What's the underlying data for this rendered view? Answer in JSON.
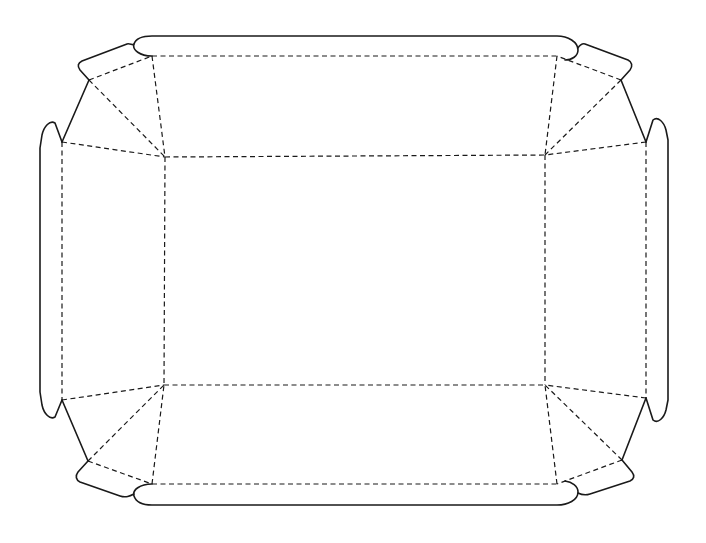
{
  "diagram": {
    "type": "die-cut tray template",
    "width": 706,
    "height": 543,
    "colors": {
      "background": "#ffffff",
      "line": "#1a1a1a"
    },
    "line_styles": {
      "cut": "solid",
      "fold": "dashed"
    },
    "base_panel": {
      "corners": {
        "tl": [
          165,
          157
        ],
        "tr": [
          545,
          155
        ],
        "br": [
          545,
          385
        ],
        "bl": [
          164,
          385
        ]
      }
    },
    "cut_paths": [
      {
        "name": "top-wall-outline",
        "d": "M152 56 C140 56 132 50 134 44 C136 38 142 36 152 36 L557 36 C568 36 578 42 578 50 C578 56 572 60 565 60"
      },
      {
        "name": "bottom-wall-outline",
        "d": "M152 484 C140 484 132 490 134 496 C136 502 142 505 152 505 L557 505 C568 505 578 500 578 492 C578 486 572 482 565 481"
      },
      {
        "name": "left-wall-outline",
        "d": "M62 142 L55 123 C50 120 44 126 42 135 L40 148 L40 392 L42 405 C44 414 50 420 55 417 L62 400"
      },
      {
        "name": "right-wall-outline",
        "d": "M646 142 L653 120 C658 116 664 122 666 130 L668 140 L668 400 L666 410 C664 418 658 424 653 420 L646 398"
      },
      {
        "name": "top-left-corner-tab",
        "d": "M89 80 L80 70 C77 66 78 63 82 61 L127 44 C130 43 133 46 134 44"
      },
      {
        "name": "top-left-gusset-edge",
        "d": "M89 80 L62 142"
      },
      {
        "name": "top-right-corner-tab",
        "d": "M621 80 L630 70 C633 66 632 62 628 60 L585 44 C582 43 579 46 578 48"
      },
      {
        "name": "top-right-gusset-edge",
        "d": "M621 80 L646 142"
      },
      {
        "name": "bottom-left-corner-tab",
        "d": "M88 461 L78 472 C75 476 76 480 80 482 L120 496 C126 498 130 496 134 494"
      },
      {
        "name": "bottom-left-gusset-edge",
        "d": "M88 461 L62 400"
      },
      {
        "name": "bottom-right-corner-tab",
        "d": "M622 460 L632 472 C635 476 634 479 630 481 L590 494 C584 496 580 494 578 493"
      },
      {
        "name": "bottom-right-gusset-edge",
        "d": "M622 460 L646 398"
      }
    ],
    "fold_paths": [
      {
        "name": "base-top-fold",
        "d": "M165 157 L545 155"
      },
      {
        "name": "base-bottom-fold",
        "d": "M164 385 L545 385"
      },
      {
        "name": "base-left-fold",
        "d": "M165 157 L164 385"
      },
      {
        "name": "base-right-fold",
        "d": "M545 155 L545 385"
      },
      {
        "name": "top-wall-fold",
        "d": "M152 56 L557 56"
      },
      {
        "name": "bottom-wall-fold",
        "d": "M152 484 L557 484"
      },
      {
        "name": "left-wall-fold",
        "d": "M62 142 L62 400"
      },
      {
        "name": "right-wall-fold",
        "d": "M646 142 L646 398"
      },
      {
        "name": "tl-top-wall-side",
        "d": "M152 56 L165 157"
      },
      {
        "name": "tl-left-wall-side",
        "d": "M62 142 L165 157"
      },
      {
        "name": "tl-gusset-diagonal",
        "d": "M89 80 L165 157"
      },
      {
        "name": "tl-tab-fold",
        "d": "M89 80 L152 56"
      },
      {
        "name": "tr-top-wall-side",
        "d": "M557 56 L545 155"
      },
      {
        "name": "tr-right-wall-side",
        "d": "M646 142 L545 155"
      },
      {
        "name": "tr-gusset-diagonal",
        "d": "M621 80 L545 155"
      },
      {
        "name": "tr-tab-fold",
        "d": "M621 80 L557 56"
      },
      {
        "name": "bl-bottom-wall-side",
        "d": "M152 484 L164 385"
      },
      {
        "name": "bl-left-wall-side",
        "d": "M62 400 L164 385"
      },
      {
        "name": "bl-gusset-diagonal",
        "d": "M88 461 L164 385"
      },
      {
        "name": "bl-tab-fold",
        "d": "M88 461 L152 484"
      },
      {
        "name": "br-bottom-wall-side",
        "d": "M557 484 L545 385"
      },
      {
        "name": "br-right-wall-side",
        "d": "M646 398 L545 385"
      },
      {
        "name": "br-gusset-diagonal",
        "d": "M622 460 L545 385"
      },
      {
        "name": "br-tab-fold",
        "d": "M622 460 L557 484"
      }
    ]
  }
}
